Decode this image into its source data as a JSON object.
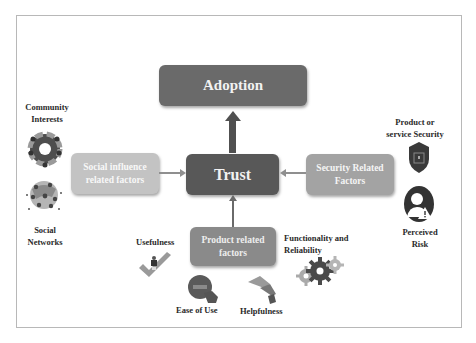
{
  "diagram": {
    "center": {
      "label": "Trust"
    },
    "top": {
      "label": "Adoption"
    },
    "left_factor": {
      "label_line1": "Social influence",
      "label_line2": "related factors"
    },
    "right_factor": {
      "label_line1": "Security Related",
      "label_line2": "Factors"
    },
    "bottom_factor": {
      "label_line1": "Product related",
      "label_line2": "factors"
    },
    "left_items": [
      {
        "line1": "Community",
        "line2": "Interests",
        "icon": "community-circle-icon"
      },
      {
        "line1": "Social",
        "line2": "Networks",
        "icon": "social-network-globe-icon"
      }
    ],
    "right_items": [
      {
        "line1": "Product or",
        "line2": "service Security",
        "icon": "shield-lock-icon"
      },
      {
        "line1": "Perceived",
        "line2": "Risk",
        "icon": "person-warning-icon"
      }
    ],
    "bottom_items": [
      {
        "label": "Usefulness",
        "icon": "checkmark-icon"
      },
      {
        "label": "Ease of Use",
        "icon": "touch-button-icon"
      },
      {
        "label": "Helpfulness",
        "icon": "helping-hand-icon"
      },
      {
        "line1": "Functionality and",
        "line2": "Reliability",
        "icon": "gears-icon"
      }
    ],
    "colors": {
      "adoption": "#6a6a6a",
      "trust": "#585858",
      "social": "#c3c3c3",
      "security": "#a3a3a3",
      "product": "#8a8a8a"
    }
  }
}
